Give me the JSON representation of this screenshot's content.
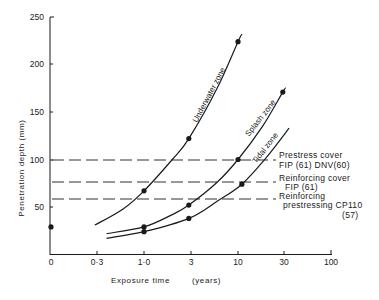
{
  "chart_data": {
    "type": "line",
    "title": "",
    "xlabel": "Exposure time",
    "xlabel_unit": "(years)",
    "ylabel": "Penetration depth (mm)",
    "x_scale": "log-like (0 at origin)",
    "x_ticks": [
      "0",
      "0·3",
      "1·0",
      "3",
      "10",
      "30",
      "100"
    ],
    "x_tick_values": [
      0,
      0.3,
      1.0,
      3,
      10,
      30,
      100
    ],
    "y_ticks": [
      "50",
      "100",
      "150",
      "200",
      "250"
    ],
    "y_tick_values": [
      50,
      100,
      150,
      200,
      250
    ],
    "ylim": [
      0,
      250
    ],
    "grid": false,
    "series": [
      {
        "name": "Underwater zone",
        "points": [
          {
            "x": 1.0,
            "y": 67
          },
          {
            "x": 3,
            "y": 122
          },
          {
            "x": 10,
            "y": 224
          }
        ],
        "curve": [
          {
            "x": 0.3,
            "y": 31
          },
          {
            "x": 0.6,
            "y": 48
          },
          {
            "x": 1.0,
            "y": 67
          },
          {
            "x": 2.0,
            "y": 100
          },
          {
            "x": 3,
            "y": 122
          },
          {
            "x": 6,
            "y": 175
          },
          {
            "x": 10,
            "y": 224
          },
          {
            "x": 11,
            "y": 232
          }
        ]
      },
      {
        "name": "Splash zone",
        "points": [
          {
            "x": 1.0,
            "y": 29
          },
          {
            "x": 3,
            "y": 52
          },
          {
            "x": 10,
            "y": 100
          },
          {
            "x": 30,
            "y": 171
          }
        ],
        "curve": [
          {
            "x": 0.4,
            "y": 22
          },
          {
            "x": 1.0,
            "y": 29
          },
          {
            "x": 2.0,
            "y": 42
          },
          {
            "x": 3,
            "y": 52
          },
          {
            "x": 6,
            "y": 76
          },
          {
            "x": 10,
            "y": 100
          },
          {
            "x": 18,
            "y": 134
          },
          {
            "x": 30,
            "y": 171
          },
          {
            "x": 32,
            "y": 175
          }
        ]
      },
      {
        "name": "Tidal zone",
        "points": [
          {
            "x": 1.0,
            "y": 24
          },
          {
            "x": 3,
            "y": 38
          },
          {
            "x": 11,
            "y": 74
          }
        ],
        "curve": [
          {
            "x": 0.4,
            "y": 17
          },
          {
            "x": 1.0,
            "y": 24
          },
          {
            "x": 3,
            "y": 38
          },
          {
            "x": 6,
            "y": 56
          },
          {
            "x": 11,
            "y": 74
          },
          {
            "x": 20,
            "y": 102
          },
          {
            "x": 35,
            "y": 133
          }
        ]
      }
    ],
    "isolated_points": [
      {
        "x": 0,
        "y": 29
      }
    ],
    "reference_lines": [
      {
        "y": 100,
        "label_lines": [
          "Prestress  cover",
          "FIP  (61)  DNV(60)"
        ]
      },
      {
        "y": 77,
        "label_lines": [
          "Reinforcing  cover",
          "FIP  (61)"
        ]
      },
      {
        "y": 59,
        "label_lines": [
          "Reinforcing",
          "prestressing  CP110",
          "(57)"
        ]
      }
    ]
  },
  "labels": {
    "xlabel": "Exposure  time",
    "xunit": "(years)",
    "ylabel": "Penetration  depth  (mm)",
    "underwater": "Underwater  zone",
    "splash": "Splash  zone",
    "tidal": "Tidal  zone",
    "ref1_a": "Prestress  cover",
    "ref1_b": "FIP  (61)  DNV(60)",
    "ref2_a": "Reinforcing  cover",
    "ref2_b": "FIP  (61)",
    "ref3_a": "Reinforcing",
    "ref3_b": "prestressing  CP110",
    "ref3_c": "(57)",
    "xt0": "0",
    "xt1": "0·3",
    "xt2": "1·0",
    "xt3": "3",
    "xt4": "10",
    "xt5": "30",
    "xt6": "100",
    "yt50": "50",
    "yt100": "100",
    "yt150": "150",
    "yt200": "200",
    "yt250": "250"
  },
  "colors": {
    "ink": "#1a1a1a",
    "background": "#ffffff"
  }
}
